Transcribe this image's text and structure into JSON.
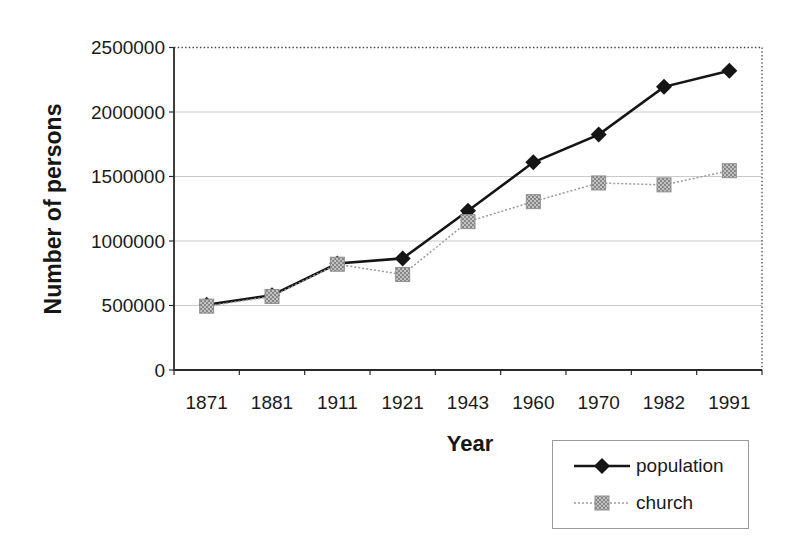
{
  "chart_data": {
    "type": "line",
    "title": "",
    "xlabel": "Year",
    "ylabel": "Number of persons",
    "categories": [
      "1871",
      "1881",
      "1911",
      "1921",
      "1943",
      "1960",
      "1970",
      "1982",
      "1991"
    ],
    "series": [
      {
        "name": "population",
        "marker": "diamond",
        "color": "#151515",
        "line_style": "solid",
        "values": [
          505000,
          580000,
          825000,
          865000,
          1235000,
          1610000,
          1825000,
          2195000,
          2320000
        ]
      },
      {
        "name": "church",
        "marker": "square",
        "color": "#9a9a9a",
        "line_style": "dotted",
        "values": [
          495000,
          570000,
          820000,
          740000,
          1150000,
          1305000,
          1450000,
          1435000,
          1545000
        ]
      }
    ],
    "ylim": [
      0,
      2500000
    ],
    "y_ticks": [
      0,
      500000,
      1000000,
      1500000,
      2000000,
      2500000
    ],
    "grid": true,
    "legend_position": "bottom-right",
    "colors": {
      "gridline": "#c9c9c9",
      "axis": "#2a2a2a",
      "frame_dotted": "#4a4a4a",
      "text": "#1a1a1a",
      "marker_square_fill_a": "#c2c2c2",
      "marker_square_fill_b": "#878787"
    }
  }
}
